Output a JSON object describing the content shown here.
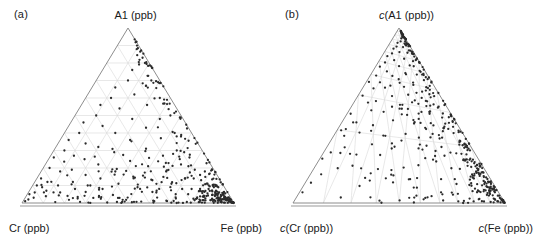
{
  "figure": {
    "background_color": "#ffffff",
    "point_color": "#2b2b2b",
    "grid_color": "#d8d8d8",
    "axis_color": "#808080",
    "text_color": "#1a1a1a"
  },
  "panels": [
    {
      "tag": "(a)",
      "top_label": "A1 (ppb)",
      "left_label": "Cr (ppb)",
      "right_label": "Fe (ppb)"
    },
    {
      "tag": "(b)",
      "top_label_prefix": "c",
      "top_label_rest": "(A1 (ppb))",
      "left_label_prefix": "c",
      "left_label_rest": "(Cr (ppb))",
      "right_label_prefix": "c",
      "right_label_rest": "(Fe (ppb))"
    }
  ],
  "chart_data": [
    {
      "type": "scatter",
      "subtype": "ternary",
      "panel": "(a)",
      "title": "",
      "top_vertex": "A1 (ppb)",
      "left_vertex": "Cr (ppb)",
      "right_vertex": "Fe (ppb)",
      "grid": true,
      "grid_divisions": 10,
      "grid_style": "regular-triangular-mesh",
      "axis_ranges": [
        0,
        1
      ],
      "legend": "none",
      "n_points": 420,
      "description": "Raw ternary composition plot of Al, Cr and Fe concentrations in ppb; points concentrate toward the Fe (bottom-right) vertex and along the lower-right edge, with a secondary trail climbing the Al-Fe (right) edge toward the apex and sparse scatter toward the Cr (bottom-left) vertex.",
      "points": [
        [
          0.02,
          0.1,
          0.88
        ],
        [
          0.03,
          0.06,
          0.91
        ],
        [
          0.01,
          0.05,
          0.94
        ],
        [
          0.02,
          0.02,
          0.96
        ],
        [
          0.01,
          0.01,
          0.98
        ],
        [
          0.04,
          0.03,
          0.93
        ],
        [
          0.02,
          0.14,
          0.84
        ],
        [
          0.05,
          0.09,
          0.86
        ],
        [
          0.03,
          0.2,
          0.77
        ],
        [
          0.06,
          0.12,
          0.82
        ],
        [
          0.08,
          0.07,
          0.85
        ],
        [
          0.02,
          0.26,
          0.72
        ],
        [
          0.05,
          0.3,
          0.65
        ],
        [
          0.09,
          0.18,
          0.73
        ],
        [
          0.12,
          0.1,
          0.78
        ],
        [
          0.15,
          0.06,
          0.79
        ],
        [
          0.04,
          0.36,
          0.6
        ],
        [
          0.07,
          0.4,
          0.53
        ],
        [
          0.11,
          0.27,
          0.62
        ],
        [
          0.14,
          0.19,
          0.67
        ],
        [
          0.18,
          0.12,
          0.7
        ],
        [
          0.21,
          0.08,
          0.71
        ],
        [
          0.06,
          0.46,
          0.48
        ],
        [
          0.1,
          0.5,
          0.4
        ],
        [
          0.13,
          0.34,
          0.53
        ],
        [
          0.17,
          0.25,
          0.58
        ],
        [
          0.22,
          0.16,
          0.62
        ],
        [
          0.26,
          0.1,
          0.64
        ],
        [
          0.09,
          0.56,
          0.35
        ],
        [
          0.12,
          0.6,
          0.28
        ],
        [
          0.16,
          0.44,
          0.4
        ],
        [
          0.2,
          0.32,
          0.48
        ],
        [
          0.25,
          0.22,
          0.53
        ],
        [
          0.3,
          0.14,
          0.56
        ],
        [
          0.34,
          0.08,
          0.58
        ],
        [
          0.11,
          0.66,
          0.23
        ],
        [
          0.15,
          0.7,
          0.15
        ],
        [
          0.19,
          0.54,
          0.27
        ],
        [
          0.24,
          0.4,
          0.36
        ],
        [
          0.29,
          0.29,
          0.42
        ],
        [
          0.35,
          0.18,
          0.47
        ],
        [
          0.4,
          0.11,
          0.49
        ],
        [
          0.14,
          0.76,
          0.1
        ],
        [
          0.18,
          0.8,
          0.02
        ],
        [
          0.22,
          0.62,
          0.16
        ],
        [
          0.28,
          0.48,
          0.24
        ],
        [
          0.33,
          0.36,
          0.31
        ],
        [
          0.39,
          0.24,
          0.37
        ],
        [
          0.45,
          0.15,
          0.4
        ],
        [
          0.5,
          0.09,
          0.41
        ],
        [
          0.26,
          0.7,
          0.04
        ],
        [
          0.31,
          0.56,
          0.13
        ],
        [
          0.37,
          0.43,
          0.2
        ],
        [
          0.43,
          0.31,
          0.26
        ],
        [
          0.49,
          0.21,
          0.3
        ],
        [
          0.55,
          0.13,
          0.32
        ],
        [
          0.6,
          0.07,
          0.33
        ],
        [
          0.35,
          0.6,
          0.05
        ],
        [
          0.41,
          0.48,
          0.11
        ],
        [
          0.47,
          0.37,
          0.16
        ],
        [
          0.53,
          0.27,
          0.2
        ],
        [
          0.59,
          0.18,
          0.23
        ],
        [
          0.65,
          0.11,
          0.24
        ],
        [
          0.7,
          0.05,
          0.25
        ],
        [
          0.45,
          0.5,
          0.05
        ],
        [
          0.52,
          0.4,
          0.08
        ],
        [
          0.58,
          0.3,
          0.12
        ],
        [
          0.64,
          0.22,
          0.14
        ],
        [
          0.7,
          0.14,
          0.16
        ],
        [
          0.76,
          0.08,
          0.16
        ],
        [
          0.56,
          0.38,
          0.06
        ],
        [
          0.62,
          0.29,
          0.09
        ],
        [
          0.68,
          0.21,
          0.11
        ],
        [
          0.74,
          0.14,
          0.12
        ],
        [
          0.8,
          0.08,
          0.12
        ],
        [
          0.85,
          0.04,
          0.11
        ],
        [
          0.66,
          0.26,
          0.08
        ],
        [
          0.72,
          0.19,
          0.09
        ],
        [
          0.78,
          0.13,
          0.09
        ],
        [
          0.84,
          0.08,
          0.08
        ],
        [
          0.89,
          0.04,
          0.07
        ],
        [
          0.93,
          0.02,
          0.05
        ],
        [
          0.76,
          0.16,
          0.08
        ],
        [
          0.82,
          0.11,
          0.07
        ],
        [
          0.88,
          0.07,
          0.05
        ],
        [
          0.92,
          0.04,
          0.04
        ],
        [
          0.95,
          0.02,
          0.03
        ],
        [
          0.97,
          0.01,
          0.02
        ],
        [
          0.86,
          0.09,
          0.05
        ],
        [
          0.9,
          0.06,
          0.04
        ],
        [
          0.94,
          0.03,
          0.03
        ],
        [
          0.96,
          0.02,
          0.02
        ],
        [
          0.98,
          0.01,
          0.01
        ],
        [
          0.99,
          0.005,
          0.005
        ]
      ],
      "axes_note": "Barycentric coordinates given as [Fe-fraction, Al-fraction, Cr-fraction] proxies summing to 1"
    },
    {
      "type": "scatter",
      "subtype": "ternary",
      "panel": "(b)",
      "title": "",
      "top_vertex": "c(A1 (ppb))",
      "left_vertex": "c(Cr (ppb))",
      "right_vertex": "c(Fe (ppb))",
      "grid": true,
      "grid_style": "warped-mesh-radiating-from-apex",
      "axis_ranges": [
        0,
        1
      ],
      "legend": "none",
      "n_points": 420,
      "description": "Centred (clr/centering-transformed) version of the same ternary data; the cloud is redistributed so that the dense mass sits toward the Cr (bottom-left) vertex with a broad diagonal band rising to the Al apex and a sparser tail toward the Fe (bottom-right) vertex. Grid lines are the images of the regular ternary grid under the centring transformation and therefore appear curved/converging on the apex.",
      "transform": "centering (perturbation by the inverse of the compositional centre)",
      "axes_note": "Same sample set as panel (a) after centring; coordinates are compositional proportions summing to 1"
    }
  ]
}
